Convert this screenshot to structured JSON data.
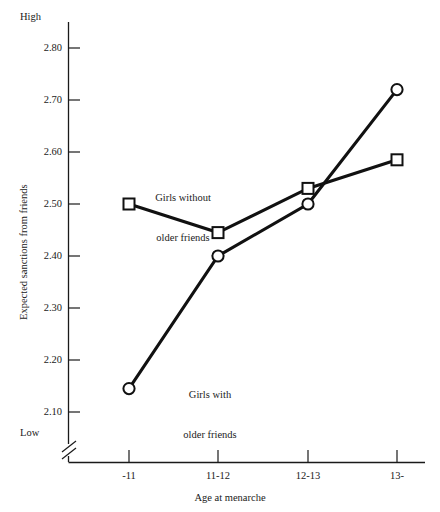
{
  "chart_data": {
    "type": "line",
    "title": "",
    "xlabel": "Age at menarche",
    "ylabel": "Expected sanctions from friends",
    "categories": [
      "-11",
      "11-12",
      "12-13",
      "13-"
    ],
    "yticks": [
      "2.80",
      "2.70",
      "2.60",
      "2.50",
      "2.40",
      "2.30",
      "2.20",
      "2.10"
    ],
    "ytick_values": [
      2.8,
      2.7,
      2.6,
      2.5,
      2.4,
      2.3,
      2.2,
      2.1
    ],
    "ylim": [
      2.1,
      2.85
    ],
    "y_axis_high_label": "High",
    "y_axis_low_label": "Low",
    "y_axis_broken": true,
    "grid": false,
    "legend_position": "inline-annotations",
    "series": [
      {
        "name": "Girls without older friends",
        "marker": "square",
        "values": [
          2.5,
          2.445,
          2.53,
          2.585
        ]
      },
      {
        "name": "Girls with older friends",
        "marker": "circle",
        "values": [
          2.145,
          2.4,
          2.5,
          2.72
        ]
      }
    ],
    "annotations": [
      {
        "id": "without",
        "lines": [
          "Girls without",
          "older friends"
        ]
      },
      {
        "id": "with",
        "lines": [
          "Girls with",
          "older friends"
        ]
      }
    ]
  }
}
